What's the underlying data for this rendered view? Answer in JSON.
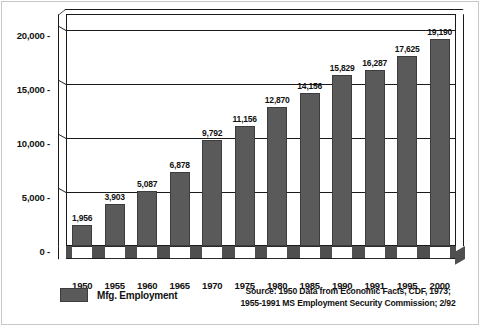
{
  "chart_data": {
    "type": "bar",
    "title": "",
    "xlabel": "",
    "ylabel": "",
    "categories": [
      "1950",
      "1955",
      "1960",
      "1965",
      "1970",
      "1975",
      "1980",
      "1985",
      "1990",
      "1991",
      "1995",
      "2000"
    ],
    "values": [
      1956,
      3903,
      5087,
      6878,
      9792,
      11156,
      12870,
      14156,
      15829,
      16287,
      17625,
      19190
    ],
    "value_labels": [
      "1,956",
      "3,903",
      "5,087",
      "6,878",
      "9,792",
      "11,156",
      "12,870",
      "14,156",
      "15,829",
      "16,287",
      "17,625",
      "19,190"
    ],
    "series": [
      {
        "name": "Mfg. Employment",
        "values": [
          1956,
          3903,
          5087,
          6878,
          9792,
          11156,
          12870,
          14156,
          15829,
          16287,
          17625,
          19190
        ]
      }
    ],
    "ylim": [
      0,
      21500
    ],
    "yticks": [
      0,
      5000,
      10000,
      15000,
      20000
    ],
    "ytick_labels": [
      "0 -",
      "5,000 -",
      "10,000 -",
      "15,000 -",
      "20,000 -"
    ],
    "grid": true,
    "grid_axis": "y",
    "legend_position": "bottom-left",
    "bar_color": "#5a5a5a",
    "style": "3d-box",
    "data_labels_shown": true
  },
  "legend": {
    "series_label": "Mfg. Employment"
  },
  "source": {
    "line1": "Source: 1950 Data from Economic Facts, CDF, 1973;",
    "line2": "1955-1991 MS Employment Security Commission; 2/92"
  },
  "colors": {
    "bar": "#5a5a5a",
    "bar_edge": "#3d3d3d",
    "frame": "#1a1a1a",
    "floor": "#4f4f4f",
    "text": "#111111",
    "background": "#ffffff"
  }
}
